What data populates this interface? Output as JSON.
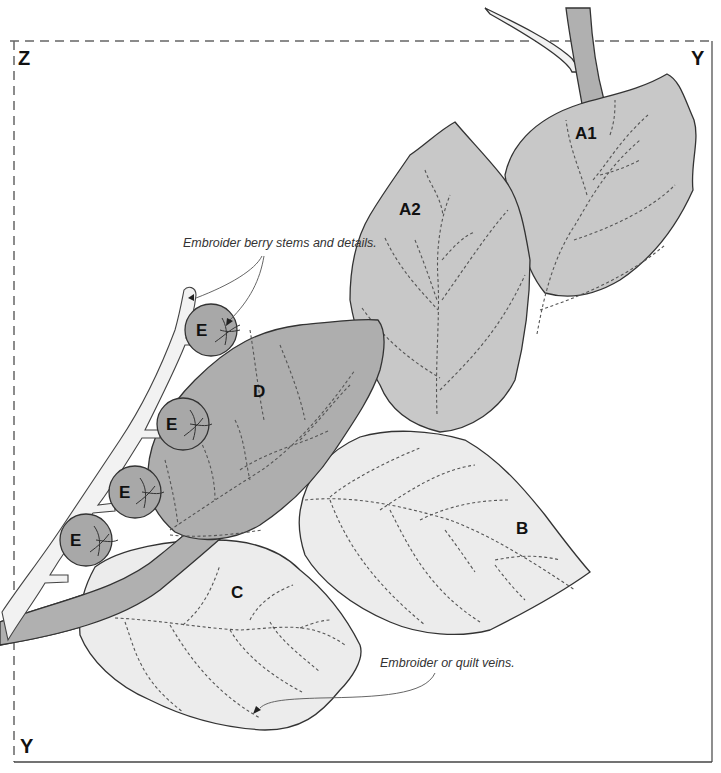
{
  "diagram": {
    "corners": {
      "top_left": "Z",
      "top_right": "Y",
      "bottom_left": "Y"
    },
    "pieces": [
      {
        "id": "A1",
        "label": "A1",
        "type": "leaf",
        "shade": "medium"
      },
      {
        "id": "A2",
        "label": "A2",
        "type": "leaf",
        "shade": "medium"
      },
      {
        "id": "B",
        "label": "B",
        "type": "leaf",
        "shade": "light"
      },
      {
        "id": "C",
        "label": "C",
        "type": "leaf",
        "shade": "light"
      },
      {
        "id": "D",
        "label": "D",
        "type": "leaf",
        "shade": "dark"
      },
      {
        "id": "E1",
        "label": "E",
        "type": "berry"
      },
      {
        "id": "E2",
        "label": "E",
        "type": "berry"
      },
      {
        "id": "E3",
        "label": "E",
        "type": "berry"
      },
      {
        "id": "E4",
        "label": "E",
        "type": "berry"
      }
    ],
    "annotations": {
      "berry_note": "Embroider berry stems and details.",
      "vein_note": "Embroider or quilt veins."
    },
    "colors": {
      "leaf_medium": "#c8c8c8",
      "leaf_light": "#ececec",
      "leaf_dark": "#aeaeae",
      "berry": "#a8a8a8",
      "stem": "#b0b0b0",
      "berry_stem": "#f2f2f2",
      "outline": "#333333"
    }
  }
}
